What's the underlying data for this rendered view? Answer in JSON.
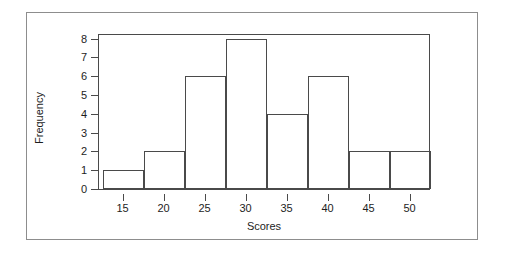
{
  "figure": {
    "background_color": "#ffffff",
    "frame_color": "#8d8d8d",
    "axis_color": "#4a4a4a",
    "text_color": "#1d1d1d"
  },
  "chart_data": {
    "type": "bar",
    "title": "",
    "xlabel": "Scores",
    "ylabel": "Frequency",
    "xlim": [
      12.0,
      52.5
    ],
    "ylim": [
      0,
      8.3
    ],
    "grid": false,
    "legend": null,
    "bin_width": 5,
    "bin_edges": [
      12.5,
      17.5,
      22.5,
      27.5,
      32.5,
      37.5,
      42.5,
      47.5,
      52.5
    ],
    "categories": [
      "12.5-17.5",
      "17.5-22.5",
      "22.5-27.5",
      "27.5-32.5",
      "32.5-37.5",
      "37.5-42.5",
      "42.5-47.5",
      "47.5-52.5"
    ],
    "values": [
      1,
      2,
      6,
      8,
      4,
      6,
      2,
      2
    ],
    "xticks": [
      15,
      20,
      25,
      30,
      35,
      40,
      45,
      50
    ],
    "xtick_labels": [
      "15",
      "20",
      "25",
      "30",
      "35",
      "40",
      "45",
      "50"
    ],
    "yticks": [
      0,
      1,
      2,
      3,
      4,
      5,
      6,
      7,
      8
    ],
    "ytick_labels": [
      "0",
      "1",
      "2",
      "3",
      "4",
      "5",
      "6",
      "7",
      "8"
    ]
  }
}
